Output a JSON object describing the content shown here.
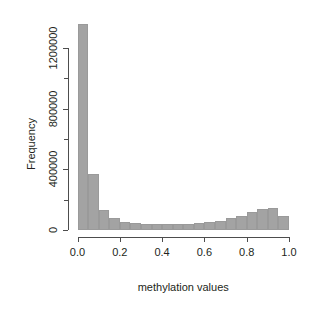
{
  "figure": {
    "width": 310,
    "height": 309,
    "background": "#ffffff",
    "bar_fill": "#a3a3a3",
    "bar_edge": "#9a9a9a",
    "axis_color": "#4d4d4d",
    "text_color": "#231f20"
  },
  "axis_titles": {
    "x": "methylation values",
    "y": "Frequency"
  },
  "x_ticks": [
    {
      "value": 0.0,
      "label": "0.0"
    },
    {
      "value": 0.2,
      "label": "0.2"
    },
    {
      "value": 0.4,
      "label": "0.4"
    },
    {
      "value": 0.6,
      "label": "0.6"
    },
    {
      "value": 0.8,
      "label": "0.8"
    },
    {
      "value": 1.0,
      "label": "1.0"
    }
  ],
  "y_ticks_major": [
    {
      "value": 0,
      "label": "0"
    },
    {
      "value": 400000,
      "label": "400000"
    },
    {
      "value": 800000,
      "label": "800000"
    },
    {
      "value": 1200000,
      "label": "1200000"
    }
  ],
  "y_ticks_minor": [
    200000,
    600000,
    1000000
  ],
  "chart_data": {
    "type": "bar",
    "title": "",
    "subtitle": "",
    "xlabel": "methylation values",
    "ylabel": "Frequency",
    "xlim": [
      0.0,
      1.0
    ],
    "ylim": [
      0,
      1400000
    ],
    "grid": false,
    "legend": "none",
    "bin_width": 0.05,
    "bin_edges": [
      0.0,
      0.05,
      0.1,
      0.15,
      0.2,
      0.25,
      0.3,
      0.35,
      0.4,
      0.45,
      0.5,
      0.55,
      0.6,
      0.65,
      0.7,
      0.75,
      0.8,
      0.85,
      0.9,
      0.95,
      1.0
    ],
    "categories": [
      "0.00-0.05",
      "0.05-0.10",
      "0.10-0.15",
      "0.15-0.20",
      "0.20-0.25",
      "0.25-0.30",
      "0.30-0.35",
      "0.35-0.40",
      "0.40-0.45",
      "0.45-0.50",
      "0.50-0.55",
      "0.55-0.60",
      "0.60-0.65",
      "0.65-0.70",
      "0.70-0.75",
      "0.75-0.80",
      "0.80-0.85",
      "0.85-0.90",
      "0.90-0.95",
      "0.95-1.00"
    ],
    "values": [
      1355000,
      368000,
      130000,
      78000,
      55000,
      46000,
      42000,
      40000,
      40000,
      40000,
      42000,
      45000,
      52000,
      62000,
      78000,
      95000,
      120000,
      140000,
      145000,
      95000
    ],
    "x_tick_labels": [
      "0.0",
      "0.2",
      "0.4",
      "0.6",
      "0.8",
      "1.0"
    ],
    "y_tick_labels": [
      "0",
      "400000",
      "800000",
      "1200000"
    ]
  }
}
